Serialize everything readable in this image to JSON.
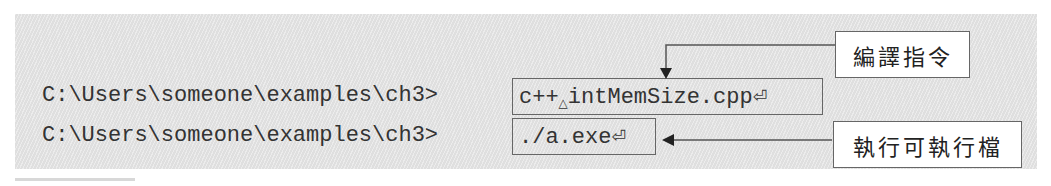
{
  "terminal": {
    "lines": [
      {
        "prompt": "C:\\Users\\someone\\examples\\ch3>",
        "command": "c++",
        "space_symbol": "△",
        "argument": "intMemSize.cpp",
        "enter_symbol": "⏎"
      },
      {
        "prompt": "C:\\Users\\someone\\examples\\ch3>",
        "command": "./a.exe",
        "enter_symbol": "⏎"
      }
    ]
  },
  "annotations": {
    "compile_label": "編譯指令",
    "run_label": "執行可執行檔"
  },
  "colors": {
    "panel": "#e6e6e6",
    "border": "#666666",
    "text": "#333333"
  }
}
